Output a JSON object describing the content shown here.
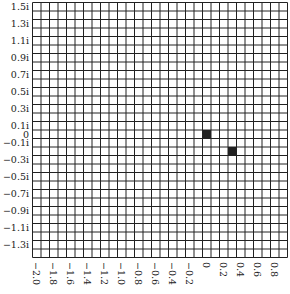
{
  "chart_data": {
    "type": "heatmap",
    "title": "",
    "xlabel": "",
    "ylabel": "",
    "grid": true,
    "x_range": [
      -2.05,
      0.95
    ],
    "y_range": [
      -1.45,
      1.55
    ],
    "cell_size": 0.1,
    "columns": 30,
    "rows": 30,
    "x_tick_labels": [
      "−2.0",
      "−1.8",
      "−1.6",
      "−1.4",
      "−1.2",
      "−1.0",
      "−0.8",
      "−0.6",
      "−0.4",
      "−0.2",
      "0",
      "0.2",
      "0.4",
      "0.6",
      "0.8"
    ],
    "x_tick_values": [
      -2.0,
      -1.8,
      -1.6,
      -1.4,
      -1.2,
      -1.0,
      -0.8,
      -0.6,
      -0.4,
      -0.2,
      0,
      0.2,
      0.4,
      0.6,
      0.8
    ],
    "y_tick_labels": [
      "1.5i",
      "1.3i",
      "1.1i",
      "0.9i",
      "0.7i",
      "0.5i",
      "0.3i",
      "0.1i",
      "0",
      "−0.1i",
      "−0.3i",
      "−0.5i",
      "−0.7i",
      "−0.9i",
      "−1.1i",
      "−1.3i"
    ],
    "y_tick_values": [
      1.5,
      1.3,
      1.1,
      0.9,
      0.7,
      0.5,
      0.3,
      0.1,
      0,
      -0.1,
      -0.3,
      -0.5,
      -0.7,
      -0.9,
      -1.1,
      -1.3
    ],
    "filled_cells": [
      {
        "re": 0.0,
        "im": 0.0
      },
      {
        "re": 0.3,
        "im": -0.2
      }
    ],
    "fill_color": "#222222",
    "grid_color": "#222222"
  }
}
